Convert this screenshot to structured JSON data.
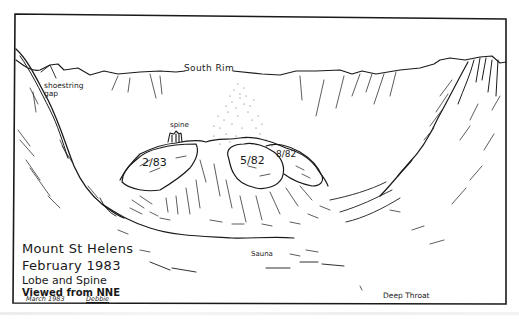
{
  "figure": {
    "type": "hand-drawn pen sketch",
    "ink_color": "#1a1a1a",
    "paper_color": "#ffffff"
  },
  "caption": {
    "line1": "Mount St Helens",
    "line2": "February 1983",
    "line3": "Lobe and Spine",
    "line4": "Viewed from NNE",
    "date_signed": "March 1983",
    "signature": "Debbie"
  },
  "labels": {
    "south_rim": "South Rim",
    "shoestring_gap": "shoestring gap",
    "spine": "spine",
    "lobe_1": "2/83",
    "lobe_2": "5/82",
    "lobe_3": "8/82",
    "sauna": "Sauna",
    "deep_throat": "Deep Throat"
  }
}
